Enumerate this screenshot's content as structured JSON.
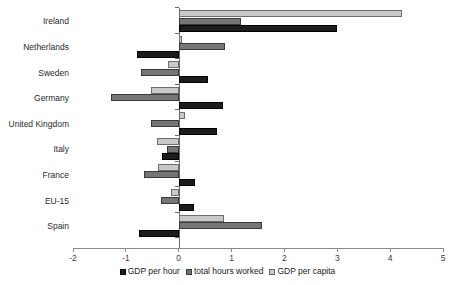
{
  "chart_data": {
    "type": "bar",
    "orientation": "horizontal",
    "title": "",
    "xlabel": "",
    "ylabel": "",
    "xlim": [
      -2,
      5
    ],
    "xticks": [
      -2,
      -1,
      0,
      1,
      2,
      3,
      4,
      5
    ],
    "xtick_labels": [
      "-2",
      "-1",
      "0",
      "1",
      "2",
      "3",
      "4",
      "5"
    ],
    "grid": false,
    "legend_position": "bottom",
    "categories": [
      "Ireland",
      "Netherlands",
      "Sweden",
      "Germany",
      "United Kingdom",
      "Italy",
      "France",
      "EU-15",
      "Spain"
    ],
    "series": [
      {
        "name": "GDP per hour",
        "color": "#1c1c1c",
        "values": [
          3.0,
          -0.78,
          0.55,
          0.83,
          0.72,
          -0.32,
          0.3,
          0.28,
          -0.75
        ]
      },
      {
        "name": "total hours worked",
        "color": "#767676",
        "values": [
          1.18,
          0.88,
          -0.72,
          -1.28,
          -0.52,
          -0.22,
          -0.66,
          -0.34,
          1.58
        ]
      },
      {
        "name": "GDP per capita",
        "color": "#c9c9c9",
        "values": [
          4.22,
          0.06,
          -0.2,
          -0.52,
          0.11,
          -0.41,
          -0.4,
          -0.15,
          0.85
        ]
      }
    ]
  }
}
